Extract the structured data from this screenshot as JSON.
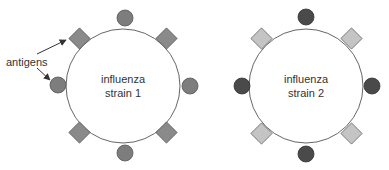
{
  "annotation": {
    "label": "antigens"
  },
  "viruses": [
    {
      "line1": "influenza",
      "line2": "strain 1",
      "circle_color": "#7d7d7d",
      "diamond_color": "#8a8a8a"
    },
    {
      "line1": "influenza",
      "line2": "strain 2",
      "circle_color": "#4a4a4a",
      "diamond_color": "#c4c4c4"
    }
  ],
  "colors": {
    "outline": "#555555",
    "stroke": "#666666"
  }
}
